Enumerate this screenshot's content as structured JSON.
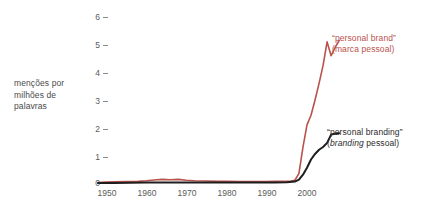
{
  "axis": {
    "ylabel_line1": "menções por",
    "ylabel_line2": "milhões de",
    "ylabel_line3": "palavras",
    "yticks": [
      "6",
      "5",
      "4",
      "3",
      "2",
      "1",
      "0"
    ],
    "xticks": [
      "1950",
      "1960",
      "1970",
      "1980",
      "1990",
      "2000"
    ]
  },
  "legend": {
    "red_main": "“personal brand”",
    "red_sub": "(marca pessoal)",
    "black_main": "“personal branding”",
    "black_sub_italic": "branding",
    "black_sub_rest": " pessoal)",
    "black_sub_open": "("
  },
  "colors": {
    "red": "#b9524c",
    "black": "#1e1e1e",
    "tick": "#5a5a5a",
    "label": "#4a4a4a",
    "background": "#ffffff"
  },
  "chart_data": {
    "type": "line",
    "title": "",
    "xlabel": "",
    "ylabel": "menções por milhões de palavras",
    "xlim": [
      1948,
      2009
    ],
    "ylim": [
      0,
      6.3
    ],
    "grid": false,
    "legend_position": "right-inline",
    "xticks": [
      1950,
      1960,
      1970,
      1980,
      1990,
      2000
    ],
    "yticks": [
      0,
      1,
      2,
      3,
      4,
      5,
      6
    ],
    "series": [
      {
        "name": "“personal brand” (marca pessoal)",
        "color": "#b9524c",
        "x": [
          1948,
          1950,
          1952,
          1955,
          1958,
          1960,
          1962,
          1964,
          1966,
          1968,
          1970,
          1972,
          1975,
          1978,
          1980,
          1983,
          1986,
          1988,
          1990,
          1992,
          1994,
          1996,
          1997,
          1998,
          1999,
          2000,
          2001,
          2002,
          2003,
          2004,
          2005,
          2006,
          2007,
          2008
        ],
        "y": [
          0.02,
          0.03,
          0.04,
          0.05,
          0.06,
          0.08,
          0.11,
          0.13,
          0.12,
          0.13,
          0.1,
          0.08,
          0.07,
          0.06,
          0.06,
          0.05,
          0.05,
          0.05,
          0.05,
          0.06,
          0.06,
          0.07,
          0.1,
          0.35,
          1.3,
          2.1,
          2.45,
          3.0,
          3.6,
          4.25,
          5.1,
          4.6,
          4.9,
          5.15
        ]
      },
      {
        "name": "“personal branding” (branding pessoal)",
        "color": "#1e1e1e",
        "x": [
          1948,
          1952,
          1956,
          1960,
          1964,
          1968,
          1972,
          1976,
          1980,
          1984,
          1988,
          1992,
          1995,
          1997,
          1998,
          1999,
          2000,
          2001,
          2002,
          2003,
          2004,
          2005,
          2006,
          2007,
          2008
        ],
        "y": [
          0.0,
          0.0,
          0.01,
          0.02,
          0.02,
          0.02,
          0.02,
          0.02,
          0.02,
          0.02,
          0.02,
          0.02,
          0.03,
          0.05,
          0.12,
          0.3,
          0.55,
          0.85,
          1.05,
          1.2,
          1.3,
          1.45,
          1.75,
          1.78,
          1.8
        ]
      }
    ]
  }
}
